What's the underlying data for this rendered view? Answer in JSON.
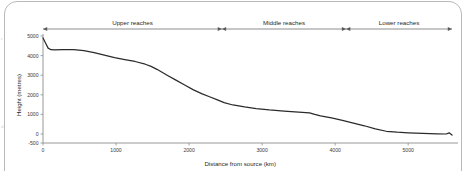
{
  "figure": {
    "kind": "river-long-profile",
    "frame_color": "#b9b9b9",
    "edge_artifacts": [
      "r",
      "d"
    ]
  },
  "chart_data": {
    "type": "line",
    "title": "",
    "subtitle": "",
    "xlabel": "Distance from source (km)",
    "ylabel": "Height (metres)",
    "xlim": [
      0,
      5600
    ],
    "ylim": [
      -500,
      5000
    ],
    "xticks": [
      0,
      1000,
      2000,
      3000,
      4000,
      5000
    ],
    "xticklabels": [
      "0",
      "1000",
      "2000",
      "3000",
      "4000",
      "5000"
    ],
    "yticks": [
      -500,
      0,
      1000,
      2000,
      3000,
      4000,
      5000
    ],
    "yticklabels": [
      "-500",
      "0",
      "1000",
      "2000",
      "3000",
      "4000",
      "5000"
    ],
    "grid": false,
    "legend": null,
    "line_color": "#2b2b2b",
    "series": [
      {
        "name": "River long profile",
        "x": [
          0,
          40,
          70,
          110,
          160,
          260,
          420,
          560,
          700,
          840,
          980,
          1120,
          1260,
          1400,
          1480,
          1560,
          1700,
          1820,
          1940,
          2060,
          2180,
          2280,
          2380,
          2480,
          2600,
          2760,
          2920,
          3100,
          3300,
          3500,
          3650,
          3720,
          3800,
          3950,
          4100,
          4250,
          4400,
          4550,
          4700,
          4850,
          5000,
          5200,
          5400,
          5520,
          5560,
          5600
        ],
        "y": [
          4900,
          4600,
          4380,
          4300,
          4290,
          4300,
          4300,
          4250,
          4150,
          4020,
          3900,
          3800,
          3700,
          3560,
          3450,
          3300,
          3000,
          2750,
          2500,
          2250,
          2050,
          1900,
          1750,
          1600,
          1480,
          1380,
          1300,
          1230,
          1170,
          1120,
          1080,
          1000,
          930,
          820,
          700,
          560,
          420,
          260,
          140,
          90,
          60,
          30,
          10,
          0,
          60,
          -60
        ]
      }
    ],
    "annotations": [
      {
        "label": "Upper reaches",
        "x_start": 0,
        "x_end": 2450,
        "style": "double-arrow"
      },
      {
        "label": "Middle reaches",
        "x_start": 2450,
        "x_end": 4150,
        "style": "double-arrow"
      },
      {
        "label": "Lower reaches",
        "x_start": 4150,
        "x_end": 5600,
        "style": "double-arrow"
      }
    ]
  }
}
